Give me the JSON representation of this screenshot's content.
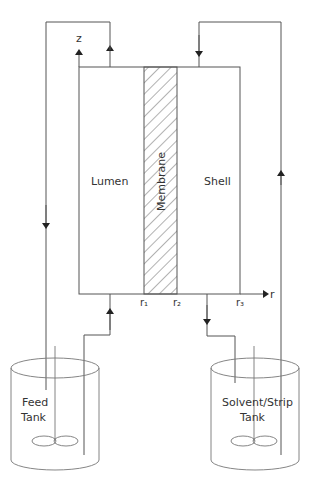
{
  "diagram": {
    "regions": {
      "lumen": "Lumen",
      "membrane": "Membrane",
      "shell": "Shell"
    },
    "axes": {
      "z_label": "z",
      "r_label": "r",
      "r_ticks": [
        "r₁",
        "r₂",
        "r₃"
      ]
    },
    "tanks": {
      "feed": {
        "line1": "Feed",
        "line2": "Tank"
      },
      "solvent": {
        "line1": "Solvent/Strip",
        "line2": "Tank"
      }
    },
    "colors": {
      "line": "#555555",
      "hatch": "#666666",
      "background": "#ffffff"
    }
  }
}
